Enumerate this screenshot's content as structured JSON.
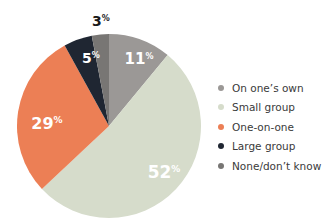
{
  "chart_data": {
    "type": "pie",
    "title": "",
    "categories": [
      "On one's own",
      "Small group",
      "One-on-one",
      "Large group",
      "None/don't know"
    ],
    "values": [
      11,
      52,
      29,
      5,
      3
    ],
    "labels": [
      "11%",
      "52%",
      "29%",
      "5%",
      "3%"
    ],
    "colors": [
      "#9b9896",
      "#d6dccb",
      "#ec7f55",
      "#1f2632",
      "#787674"
    ],
    "start_angle": "12 o'clock",
    "direction": "clockwise",
    "legend_position": "right"
  },
  "legend": [
    {
      "label": "On one’s own",
      "color": "#9b9896"
    },
    {
      "label": "Small group",
      "color": "#d6dccb"
    },
    {
      "label": "One-on-one",
      "color": "#ec7f55"
    },
    {
      "label": "Large group",
      "color": "#1f2632"
    },
    {
      "label": "None/don’t know",
      "color": "#787674"
    }
  ]
}
